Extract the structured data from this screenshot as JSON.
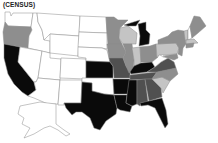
{
  "map": {
    "title": "(CENSUS)",
    "type": "choropleth",
    "region": "United States",
    "palette": {
      "white": "#ffffff",
      "light": "#c4c4c4",
      "mid": "#8e8e8e",
      "dark": "#505050",
      "black": "#0a0a0a"
    }
  }
}
